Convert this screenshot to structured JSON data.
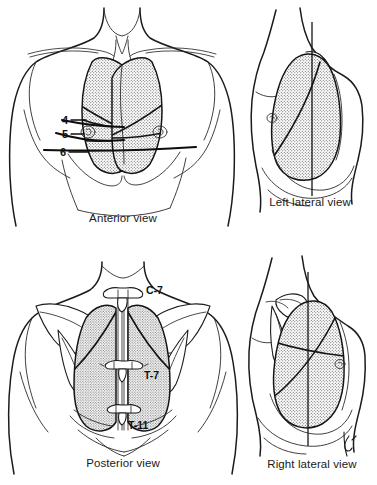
{
  "figure": {
    "background_color": "#ffffff",
    "ink_color": "#1a1a1a",
    "lung_fill_pattern": "stipple",
    "panels": [
      {
        "id": "anterior",
        "caption": "Anterior view",
        "position": "top-left",
        "lobes_visible": "upper and middle/lower lobes",
        "labels": [
          {
            "id": "rib-4",
            "text": "4",
            "kind": "rib-number"
          },
          {
            "id": "rib-5",
            "text": "5",
            "kind": "rib-number"
          },
          {
            "id": "rib-6",
            "text": "6",
            "kind": "rib-number"
          }
        ]
      },
      {
        "id": "left-lateral",
        "caption": "Left lateral view",
        "position": "top-right",
        "reference_line": "midaxillary line",
        "fissures": [
          "oblique"
        ],
        "labels": []
      },
      {
        "id": "posterior",
        "caption": "Posterior view",
        "position": "bottom-left",
        "labels": [
          {
            "id": "vertebra-c7",
            "text": "C-7",
            "kind": "vertebra"
          },
          {
            "id": "vertebra-t7",
            "text": "T-7",
            "kind": "vertebra"
          },
          {
            "id": "vertebra-t11",
            "text": "T-11",
            "kind": "vertebra"
          }
        ]
      },
      {
        "id": "right-lateral",
        "caption": "Right lateral view",
        "position": "bottom-right",
        "reference_line": "midaxillary line",
        "fissures": [
          "horizontal",
          "oblique"
        ],
        "labels": []
      }
    ]
  }
}
